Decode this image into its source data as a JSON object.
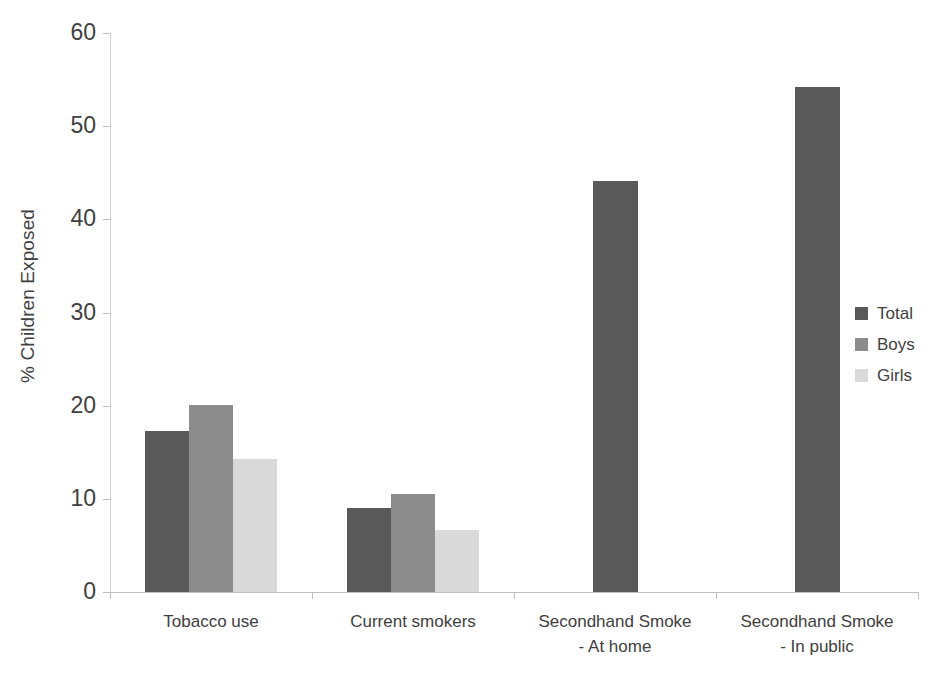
{
  "chart_data": {
    "type": "bar",
    "title": "",
    "subtitle": "",
    "xlabel": "",
    "ylabel": "% Children Exposed",
    "ylim": [
      0,
      60
    ],
    "y_ticks": [
      0,
      10,
      20,
      30,
      40,
      50,
      60
    ],
    "grid": false,
    "legend_position": "right",
    "categories": [
      "Tobacco use",
      "Current smokers",
      "Secondhand Smoke\n- At home",
      "Secondhand Smoke\n- In public"
    ],
    "series": [
      {
        "name": "Total",
        "color": "#595959",
        "values": [
          17.3,
          9.0,
          44.1,
          54.2
        ]
      },
      {
        "name": "Boys",
        "color": "#8c8c8c",
        "values": [
          20.1,
          10.5,
          null,
          null
        ]
      },
      {
        "name": "Girls",
        "color": "#d9d9d9",
        "values": [
          14.3,
          6.7,
          null,
          null
        ]
      }
    ]
  },
  "axis": {
    "y_title": "% Children Exposed",
    "y_tick_labels": [
      "0",
      "10",
      "20",
      "30",
      "40",
      "50",
      "60"
    ],
    "x_tick_labels": [
      "Tobacco use",
      "Current smokers",
      "Secondhand Smoke\n- At home",
      "Secondhand Smoke\n- In public"
    ]
  },
  "legend": {
    "entries": [
      {
        "label": "Total",
        "color": "#595959"
      },
      {
        "label": "Boys",
        "color": "#8c8c8c"
      },
      {
        "label": "Girls",
        "color": "#d9d9d9"
      }
    ]
  }
}
